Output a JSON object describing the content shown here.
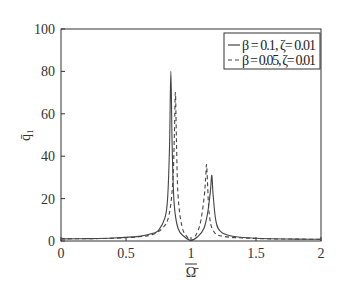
{
  "chart_data": {
    "type": "line",
    "title": "",
    "xlabel": "Ω̄",
    "ylabel": "q̄₁",
    "xlim": [
      0,
      2
    ],
    "ylim": [
      0,
      100
    ],
    "xticks": [
      0,
      0.5,
      1,
      1.5,
      2
    ],
    "xtick_labels": [
      "0",
      "0.5",
      "1",
      "1.5",
      "2"
    ],
    "yticks": [
      0,
      20,
      40,
      60,
      80,
      100
    ],
    "ytick_labels": [
      "0",
      "20",
      "40",
      "60",
      "80",
      "100"
    ],
    "grid": false,
    "legend_position": "top-right",
    "series": [
      {
        "name": "β = 0.1, ζ= 0.01",
        "style": "solid",
        "color": "#444444",
        "peaks": [
          {
            "x": 0.845,
            "y": 80
          },
          {
            "x": 1.16,
            "y": 31
          }
        ],
        "x": [
          0,
          0.2,
          0.4,
          0.6,
          0.7,
          0.75,
          0.8,
          0.82,
          0.835,
          0.845,
          0.855,
          0.87,
          0.9,
          0.95,
          1.0,
          1.05,
          1.1,
          1.13,
          1.15,
          1.16,
          1.17,
          1.19,
          1.22,
          1.3,
          1.5,
          1.8,
          2.0
        ],
        "y": [
          1.0,
          1.1,
          1.4,
          2.2,
          3.5,
          5,
          11,
          20,
          45,
          80,
          45,
          18,
          6,
          2,
          0.3,
          2,
          6,
          14,
          24,
          31,
          22,
          10,
          5,
          2.5,
          1.3,
          0.9,
          0.8
        ]
      },
      {
        "name": "β = 0.05, ζ= 0.01",
        "style": "dashed",
        "color": "#444444",
        "peaks": [
          {
            "x": 0.88,
            "y": 70
          },
          {
            "x": 1.12,
            "y": 36
          }
        ],
        "x": [
          0,
          0.2,
          0.4,
          0.6,
          0.7,
          0.78,
          0.83,
          0.86,
          0.872,
          0.88,
          0.888,
          0.9,
          0.93,
          0.97,
          1.0,
          1.03,
          1.07,
          1.1,
          1.113,
          1.12,
          1.128,
          1.14,
          1.17,
          1.25,
          1.5,
          1.8,
          2.0
        ],
        "y": [
          1.0,
          1.1,
          1.3,
          2.0,
          3.0,
          6,
          12,
          28,
          50,
          70,
          48,
          22,
          7,
          2,
          0.2,
          2,
          8,
          20,
          30,
          36,
          26,
          13,
          5,
          2.2,
          1.2,
          0.9,
          0.8
        ]
      }
    ]
  }
}
